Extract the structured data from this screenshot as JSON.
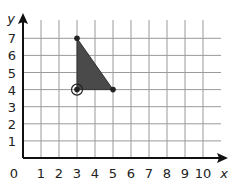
{
  "diagram": {
    "type": "coordinate-grid",
    "axes": {
      "x_label": "x",
      "y_label": "y",
      "origin_label": "0",
      "x_ticks": [
        "1",
        "2",
        "3",
        "4",
        "5",
        "6",
        "7",
        "8",
        "9",
        "10"
      ],
      "y_ticks": [
        "1",
        "2",
        "3",
        "4",
        "5",
        "6",
        "7"
      ]
    },
    "shape": {
      "type": "triangle",
      "vertices": [
        [
          3,
          7
        ],
        [
          3,
          4
        ],
        [
          5,
          4
        ]
      ],
      "fill": "#4a4a4a",
      "circled_vertex": [
        3,
        4
      ]
    },
    "colors": {
      "grid": "#9a9a9a",
      "axis": "#111111",
      "fill": "#4a4a4a"
    }
  }
}
